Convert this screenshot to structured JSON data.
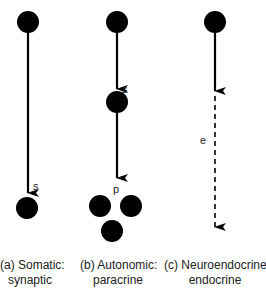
{
  "diagram": {
    "colors": {
      "ink": "#000000",
      "text": "#222222",
      "background": "#ffffff"
    },
    "panels": [
      {
        "id": "a",
        "caption_line1": "(a) Somatic:",
        "caption_line2": "synaptic",
        "arrow_labels": [
          "s"
        ]
      },
      {
        "id": "b",
        "caption_line1": "(b) Autonomic:",
        "caption_line2": "paracrine",
        "arrow_labels": [
          "s",
          "p"
        ]
      },
      {
        "id": "c",
        "caption_line1": "(c) Neuroendocrine:",
        "caption_line2": "endocrine",
        "arrow_labels": [
          "e"
        ]
      }
    ]
  }
}
